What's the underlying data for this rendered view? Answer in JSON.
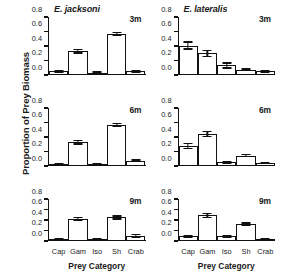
{
  "figure": {
    "ylabel": "Proportion of Prey Biomass",
    "xlabel": "Prey Category"
  },
  "chart_data": {
    "type": "bar",
    "xlabel": "Prey Category",
    "ylabel": "Proportion of Prey Biomass",
    "categories": [
      "Cap",
      "Gam",
      "Iso",
      "Sh",
      "Crab"
    ],
    "ylim": [
      0.0,
      0.8
    ],
    "yticks": [
      0.0,
      0.2,
      0.4,
      0.6,
      0.8
    ],
    "ytick_labels": [
      "0.0",
      "0.2",
      "0.4",
      "0.6",
      "0.8"
    ],
    "grid": false,
    "legend": "none",
    "layout": {
      "rows": 3,
      "columns": 2,
      "column_titles": [
        "E. jacksoni",
        "E. lateralis"
      ],
      "row_labels": [
        "3m",
        "6m",
        "9m"
      ]
    },
    "panels": [
      {
        "species": "E. jacksoni",
        "depth": "3m",
        "row": 0,
        "column": 0,
        "values": [
          0.04,
          0.32,
          0.02,
          0.56,
          0.04
        ],
        "errors": [
          0.01,
          0.025,
          0.008,
          0.02,
          0.012
        ]
      },
      {
        "species": "E. lateralis",
        "depth": "3m",
        "row": 0,
        "column": 1,
        "values": [
          0.4,
          0.29,
          0.12,
          0.06,
          0.04
        ],
        "errors": [
          0.05,
          0.04,
          0.035,
          0.012,
          0.01
        ]
      },
      {
        "species": "E. jacksoni",
        "depth": "6m",
        "row": 1,
        "column": 0,
        "values": [
          0.01,
          0.32,
          0.01,
          0.56,
          0.06
        ],
        "errors": [
          0.004,
          0.025,
          0.004,
          0.02,
          0.012
        ]
      },
      {
        "species": "E. lateralis",
        "depth": "6m",
        "row": 1,
        "column": 1,
        "values": [
          0.27,
          0.44,
          0.04,
          0.13,
          0.03
        ],
        "errors": [
          0.035,
          0.035,
          0.01,
          0.015,
          0.008
        ]
      },
      {
        "species": "E. jacksoni",
        "depth": "9m",
        "row": 2,
        "column": 0,
        "values": [
          0.02,
          0.41,
          0.02,
          0.44,
          0.08
        ],
        "errors": [
          0.006,
          0.025,
          0.006,
          0.03,
          0.025
        ]
      },
      {
        "species": "E. lateralis",
        "depth": "9m",
        "row": 2,
        "column": 1,
        "values": [
          0.07,
          0.48,
          0.07,
          0.31,
          0.02
        ],
        "errors": [
          0.012,
          0.04,
          0.01,
          0.02,
          0.008
        ]
      }
    ]
  }
}
